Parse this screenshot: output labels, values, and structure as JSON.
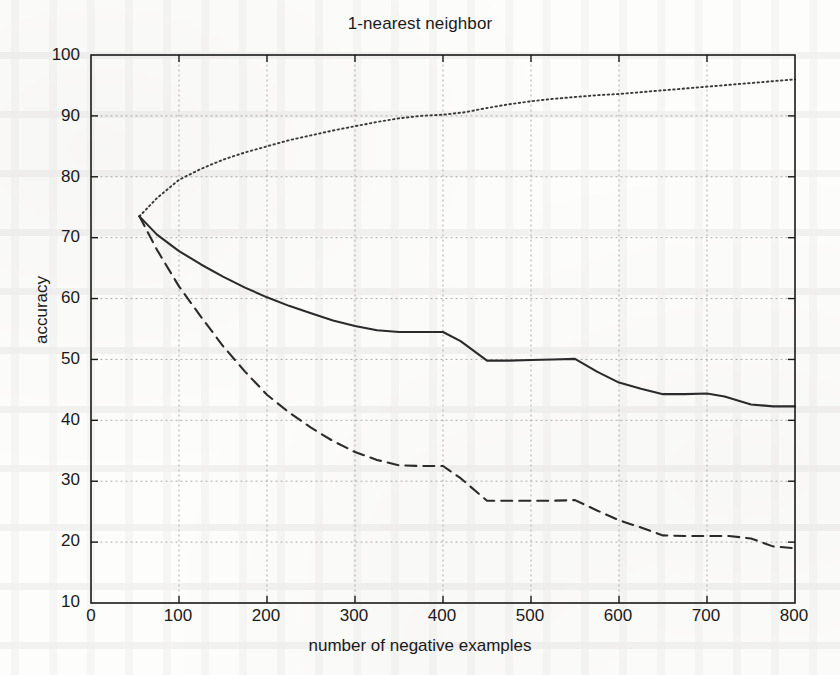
{
  "figure": {
    "title": "1-nearest neighbor",
    "xlabel": "number of negative examples",
    "ylabel": "accuracy",
    "background_color": "#fdfdfc",
    "axis_color": "#1a1a1a",
    "grid_color": "#999999"
  },
  "axes": {
    "x_ticks": [
      "0",
      "100",
      "200",
      "300",
      "400",
      "500",
      "600",
      "700",
      "800"
    ],
    "y_ticks": [
      "10",
      "20",
      "30",
      "40",
      "50",
      "60",
      "70",
      "80",
      "90",
      "100"
    ]
  },
  "chart_data": {
    "type": "line",
    "title": "1-nearest neighbor",
    "xlabel": "number of negative examples",
    "ylabel": "accuracy",
    "xlim": [
      0,
      800
    ],
    "ylim": [
      10,
      100
    ],
    "xticks": [
      0,
      100,
      200,
      300,
      400,
      500,
      600,
      700,
      800
    ],
    "yticks": [
      10,
      20,
      30,
      40,
      50,
      60,
      70,
      80,
      90,
      100
    ],
    "grid": true,
    "grid_style": "dotted",
    "legend": "none",
    "series": [
      {
        "name": "dotted-upper",
        "style": "dotted",
        "color": "#3a3a3a",
        "x": [
          55,
          75,
          100,
          125,
          150,
          175,
          200,
          225,
          250,
          275,
          300,
          325,
          350,
          375,
          400,
          425,
          450,
          475,
          500,
          525,
          550,
          575,
          600,
          625,
          650,
          675,
          700,
          725,
          750,
          775,
          800
        ],
        "y": [
          73.5,
          76.5,
          79.5,
          81.3,
          82.8,
          84.0,
          85.0,
          86.0,
          86.8,
          87.6,
          88.3,
          89.0,
          89.6,
          90.0,
          90.2,
          90.6,
          91.3,
          91.9,
          92.4,
          92.8,
          93.1,
          93.4,
          93.6,
          93.9,
          94.2,
          94.5,
          94.8,
          95.1,
          95.4,
          95.7,
          96.0
        ]
      },
      {
        "name": "solid-middle",
        "style": "solid",
        "color": "#2b2b2b",
        "x": [
          55,
          75,
          100,
          125,
          150,
          175,
          200,
          225,
          250,
          275,
          300,
          325,
          350,
          375,
          400,
          420,
          450,
          475,
          500,
          525,
          550,
          575,
          600,
          625,
          650,
          675,
          700,
          720,
          750,
          775,
          800
        ],
        "y": [
          73.5,
          70.5,
          67.8,
          65.6,
          63.6,
          61.8,
          60.2,
          58.8,
          57.6,
          56.4,
          55.5,
          54.8,
          54.5,
          54.5,
          54.5,
          53.0,
          49.8,
          49.8,
          49.9,
          50.0,
          50.1,
          48.0,
          46.2,
          45.2,
          44.3,
          44.3,
          44.4,
          43.9,
          42.6,
          42.3,
          42.3
        ]
      },
      {
        "name": "dashed-lower",
        "style": "dashed",
        "color": "#2b2b2b",
        "x": [
          55,
          75,
          100,
          125,
          150,
          175,
          200,
          225,
          250,
          275,
          300,
          325,
          350,
          375,
          400,
          420,
          450,
          475,
          500,
          525,
          550,
          575,
          600,
          625,
          650,
          675,
          700,
          725,
          750,
          775,
          800
        ],
        "y": [
          73.5,
          68.0,
          62.0,
          57.0,
          52.2,
          48.0,
          44.2,
          41.3,
          38.8,
          36.6,
          34.8,
          33.5,
          32.6,
          32.5,
          32.5,
          30.5,
          26.8,
          26.8,
          26.8,
          26.8,
          26.9,
          25.2,
          23.6,
          22.4,
          21.1,
          21.0,
          21.0,
          21.0,
          20.6,
          19.3,
          19.0
        ]
      }
    ]
  }
}
